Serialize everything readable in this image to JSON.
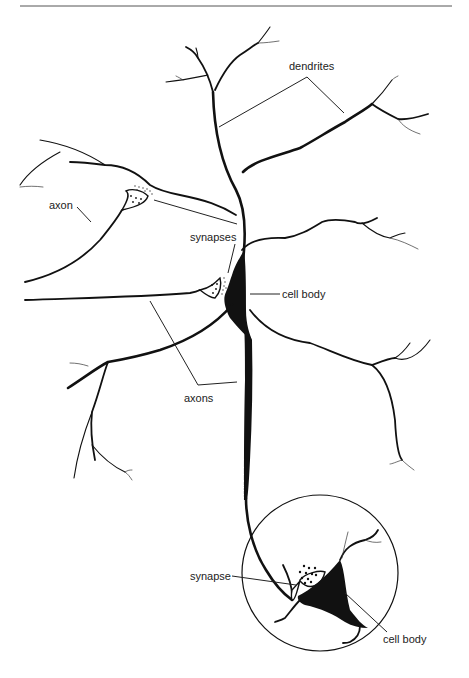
{
  "diagram": {
    "labels": {
      "dendrites": "dendrites",
      "axon": "axon",
      "synapses": "synapses",
      "cell_body_upper": "cell body",
      "axons": "axons",
      "synapse": "synapse",
      "cell_body_lower": "cell body"
    },
    "inset": {
      "description": "magnified view of a synapse onto a second neuron's cell body"
    },
    "colors": {
      "ink": "#111111",
      "background": "#ffffff",
      "rule": "#555555"
    }
  }
}
